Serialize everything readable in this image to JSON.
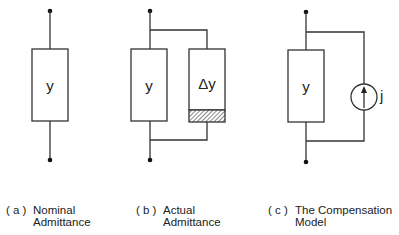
{
  "panels": {
    "a": {
      "tag": "( a )",
      "caption_line1": "Nominal",
      "caption_line2": "Admittance",
      "element_label": "y"
    },
    "b": {
      "tag": "( b )",
      "caption_line1": "Actual",
      "caption_line2": "Admittance",
      "element_label": "y",
      "delta_label": "Δy"
    },
    "c": {
      "tag": "( c )",
      "caption_line1": "The Compensation",
      "caption_line2": "Model",
      "element_label": "y",
      "source_label": "j"
    }
  },
  "colors": {
    "line": "#333333",
    "hatch": "#555555",
    "background": "#ffffff"
  }
}
